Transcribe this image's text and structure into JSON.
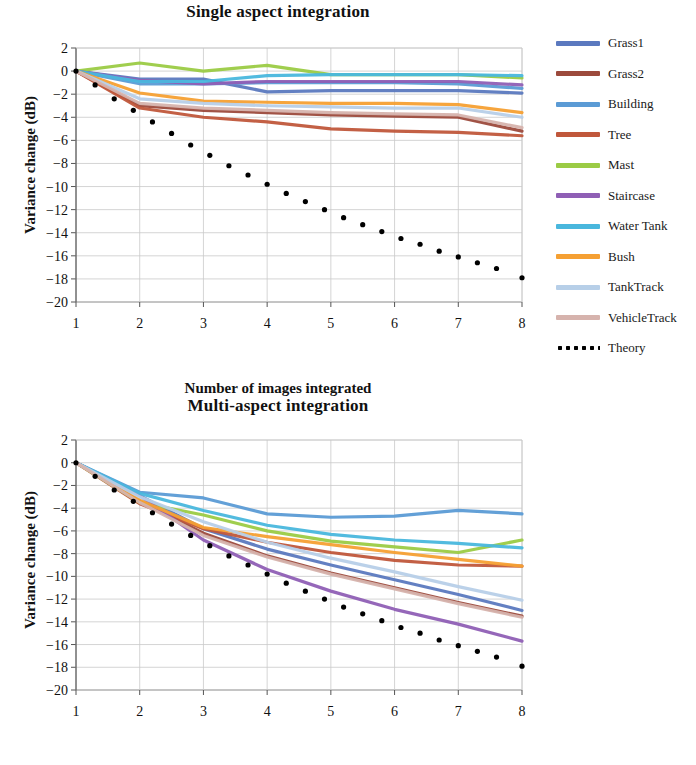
{
  "figure": {
    "axis_label_x": "Number of images integrated",
    "axis_label_y": "Variance change (dB)"
  },
  "legend": {
    "entries": [
      {
        "label": "Grass1",
        "color": "#5b79bf",
        "style": "solid"
      },
      {
        "label": "Grass2",
        "color": "#9c4a3c",
        "style": "solid"
      },
      {
        "label": "Building",
        "color": "#5b9bd5",
        "style": "solid"
      },
      {
        "label": "Tree",
        "color": "#c0573b",
        "style": "solid"
      },
      {
        "label": "Mast",
        "color": "#9bcb45",
        "style": "solid"
      },
      {
        "label": "Staircase",
        "color": "#8f5fb5",
        "style": "solid"
      },
      {
        "label": "Water Tank",
        "color": "#49b7dd",
        "style": "solid"
      },
      {
        "label": "Bush",
        "color": "#f5a033",
        "style": "solid"
      },
      {
        "label": "TankTrack",
        "color": "#b7cfe8",
        "style": "solid"
      },
      {
        "label": "VehicleTrack",
        "color": "#d6b3ad",
        "style": "solid"
      },
      {
        "label": "Theory",
        "color": "#000000",
        "style": "dotted"
      }
    ]
  },
  "chart_data": [
    {
      "type": "line",
      "title": "Single aspect integration",
      "xlabel": "Number of images integrated",
      "ylabel": "Variance change (dB)",
      "xlim": [
        1,
        8
      ],
      "ylim": [
        -20,
        2
      ],
      "xticks": [
        1,
        2,
        3,
        4,
        5,
        6,
        7,
        8
      ],
      "yticks": [
        2,
        0,
        -2,
        -4,
        -6,
        -8,
        -10,
        -12,
        -14,
        -16,
        -18,
        -20
      ],
      "grid": true,
      "legend_position": "right",
      "x": [
        1,
        2,
        3,
        4,
        5,
        6,
        7,
        8
      ],
      "series": [
        {
          "name": "Grass1",
          "color": "#5b79bf",
          "values": [
            0.0,
            -0.7,
            -0.7,
            -1.8,
            -1.7,
            -1.7,
            -1.7,
            -1.9
          ]
        },
        {
          "name": "Grass2",
          "color": "#9c4a3c",
          "values": [
            0.0,
            -3.0,
            -3.4,
            -3.6,
            -3.8,
            -3.9,
            -4.0,
            -5.2
          ]
        },
        {
          "name": "Building",
          "color": "#5b9bd5",
          "values": [
            0.0,
            -1.1,
            -1.1,
            -1.0,
            -1.0,
            -1.0,
            -1.1,
            -1.5
          ]
        },
        {
          "name": "Tree",
          "color": "#c0573b",
          "values": [
            0.0,
            -3.2,
            -4.0,
            -4.4,
            -5.0,
            -5.2,
            -5.3,
            -5.6
          ]
        },
        {
          "name": "Mast",
          "color": "#9bcb45",
          "values": [
            0.0,
            0.7,
            0.0,
            0.5,
            -0.3,
            -0.3,
            -0.3,
            -0.6
          ]
        },
        {
          "name": "Staircase",
          "color": "#8f5fb5",
          "values": [
            0.0,
            -0.8,
            -1.1,
            -0.9,
            -0.9,
            -0.9,
            -0.9,
            -1.2
          ]
        },
        {
          "name": "Water Tank",
          "color": "#49b7dd",
          "values": [
            0.0,
            -0.9,
            -0.9,
            -0.4,
            -0.3,
            -0.3,
            -0.3,
            -0.4
          ]
        },
        {
          "name": "Bush",
          "color": "#f5a033",
          "values": [
            0.0,
            -1.9,
            -2.6,
            -2.7,
            -2.8,
            -2.8,
            -2.9,
            -3.6
          ]
        },
        {
          "name": "TankTrack",
          "color": "#b7cfe8",
          "values": [
            0.0,
            -2.4,
            -2.8,
            -3.0,
            -3.1,
            -3.2,
            -3.2,
            -4.0
          ]
        },
        {
          "name": "VehicleTrack",
          "color": "#d6b3ad",
          "values": [
            0.0,
            -2.8,
            -3.2,
            -3.4,
            -3.6,
            -3.7,
            -3.8,
            -4.9
          ]
        },
        {
          "name": "Theory",
          "color": "#000000",
          "style": "dotted",
          "values": [
            0.0,
            -3.0,
            -4.8,
            -6.0,
            -7.0,
            -7.8,
            -8.5,
            -9.0
          ],
          "dense_x": [
            1.0,
            1.3,
            1.6,
            1.9,
            2.2,
            2.5,
            2.8,
            3.1,
            3.4,
            3.7,
            4.0,
            4.3,
            4.6,
            4.9,
            5.2,
            5.5,
            5.8,
            6.1,
            6.4,
            6.7,
            7.0,
            7.3,
            7.6,
            8.0
          ],
          "dense_y": [
            0.0,
            -1.2,
            -2.4,
            -3.4,
            -4.4,
            -5.4,
            -6.4,
            -7.3,
            -8.2,
            -9.0,
            -9.8,
            -10.6,
            -11.3,
            -12.0,
            -12.7,
            -13.3,
            -13.9,
            -14.5,
            -15.0,
            -15.6,
            -16.1,
            -16.6,
            -17.1,
            -17.9
          ]
        }
      ]
    },
    {
      "type": "line",
      "title": "Multi-aspect integration",
      "xlabel": "Number of images integrated",
      "ylabel": "Variance change (dB)",
      "xlim": [
        1,
        8
      ],
      "ylim": [
        -20,
        2
      ],
      "xticks": [
        1,
        2,
        3,
        4,
        5,
        6,
        7,
        8
      ],
      "yticks": [
        2,
        0,
        -2,
        -4,
        -6,
        -8,
        -10,
        -12,
        -14,
        -16,
        -18,
        -20
      ],
      "grid": true,
      "legend_position": "right",
      "x": [
        1,
        2,
        3,
        4,
        5,
        6,
        7,
        8
      ],
      "series": [
        {
          "name": "Grass1",
          "color": "#5b79bf",
          "values": [
            0.0,
            -2.9,
            -5.8,
            -7.6,
            -9.0,
            -10.3,
            -11.6,
            -13.0
          ]
        },
        {
          "name": "Grass2",
          "color": "#9c4a3c",
          "values": [
            0.0,
            -3.4,
            -6.2,
            -8.2,
            -9.7,
            -11.0,
            -12.3,
            -13.5
          ]
        },
        {
          "name": "Building",
          "color": "#5b9bd5",
          "values": [
            0.0,
            -2.6,
            -3.1,
            -4.5,
            -4.8,
            -4.7,
            -4.2,
            -4.5
          ]
        },
        {
          "name": "Tree",
          "color": "#c0573b",
          "values": [
            0.0,
            -3.6,
            -5.8,
            -7.0,
            -7.9,
            -8.6,
            -9.0,
            -9.1
          ]
        },
        {
          "name": "Mast",
          "color": "#9bcb45",
          "values": [
            0.0,
            -3.5,
            -4.6,
            -6.0,
            -6.9,
            -7.4,
            -7.9,
            -6.8
          ]
        },
        {
          "name": "Staircase",
          "color": "#8f5fb5",
          "values": [
            0.0,
            -2.9,
            -6.8,
            -9.4,
            -11.3,
            -12.9,
            -14.2,
            -15.7
          ]
        },
        {
          "name": "Water Tank",
          "color": "#49b7dd",
          "values": [
            0.0,
            -2.7,
            -4.2,
            -5.5,
            -6.3,
            -6.8,
            -7.1,
            -7.5
          ]
        },
        {
          "name": "Bush",
          "color": "#f5a033",
          "values": [
            0.0,
            -3.3,
            -5.7,
            -6.5,
            -7.2,
            -7.9,
            -8.5,
            -9.1
          ]
        },
        {
          "name": "TankTrack",
          "color": "#b7cfe8",
          "values": [
            0.0,
            -3.0,
            -5.2,
            -7.0,
            -8.4,
            -9.6,
            -10.9,
            -12.1
          ]
        },
        {
          "name": "VehicleTrack",
          "color": "#d6b3ad",
          "values": [
            0.0,
            -3.5,
            -6.4,
            -8.3,
            -9.8,
            -11.1,
            -12.4,
            -13.6
          ]
        },
        {
          "name": "Theory",
          "color": "#000000",
          "style": "dotted",
          "values": [
            0.0,
            -3.0,
            -4.8,
            -6.0,
            -7.0,
            -7.8,
            -8.5,
            -9.0
          ],
          "dense_x": [
            1.0,
            1.3,
            1.6,
            1.9,
            2.2,
            2.5,
            2.8,
            3.1,
            3.4,
            3.7,
            4.0,
            4.3,
            4.6,
            4.9,
            5.2,
            5.5,
            5.8,
            6.1,
            6.4,
            6.7,
            7.0,
            7.3,
            7.6,
            8.0
          ],
          "dense_y": [
            0.0,
            -1.2,
            -2.4,
            -3.4,
            -4.4,
            -5.4,
            -6.4,
            -7.3,
            -8.2,
            -9.0,
            -9.8,
            -10.6,
            -11.3,
            -12.0,
            -12.7,
            -13.3,
            -13.9,
            -14.5,
            -15.0,
            -15.6,
            -16.1,
            -16.6,
            -17.1,
            -17.9
          ]
        }
      ]
    }
  ]
}
